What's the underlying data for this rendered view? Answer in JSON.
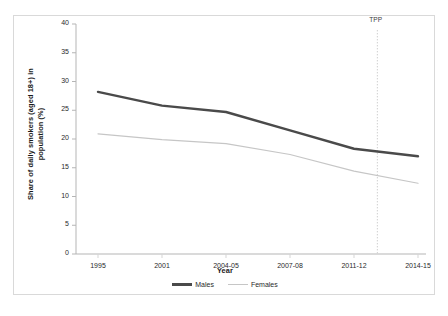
{
  "figure": {
    "top_fragment_left": "",
    "top_fragment_right": ""
  },
  "chart_data": {
    "type": "line",
    "title": "",
    "xlabel": "Year",
    "ylabel": "Share of daily smokers (aged 18+) in population (%)",
    "categories": [
      "1995",
      "2001",
      "2004-05",
      "2007-08",
      "2011-12",
      "2014-15"
    ],
    "ylim": [
      0,
      40
    ],
    "yticks": [
      0,
      5,
      10,
      15,
      20,
      25,
      30,
      35,
      40
    ],
    "ytick_labels": [
      "0",
      "5",
      "10",
      "15",
      "20",
      "25",
      "30",
      "35",
      "40"
    ],
    "grid": false,
    "legend_position": "bottom-center",
    "series": [
      {
        "name": "Males",
        "color": "#4a4a4a",
        "line_width": 2.4,
        "values": [
          28.2,
          25.8,
          24.7,
          21.5,
          18.3,
          17.0
        ]
      },
      {
        "name": "Females",
        "color": "#c6c6c6",
        "line_width": 1.2,
        "values": [
          20.9,
          19.9,
          19.2,
          17.3,
          14.4,
          12.3
        ]
      }
    ],
    "annotations": [
      {
        "label": "TPP",
        "type": "vertical-dotted-line",
        "x_fraction": 0.861,
        "color": "#cfcfcf"
      }
    ]
  }
}
